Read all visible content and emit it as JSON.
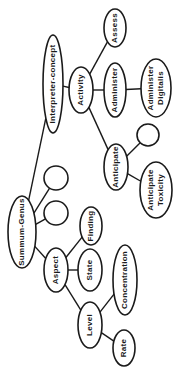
{
  "diagram": {
    "title": "",
    "orientation": "rotated -90deg",
    "nodes": [
      {
        "id": "interpreter",
        "label": "Interpreter-concept",
        "cx": 53,
        "cy": 84,
        "rx": 10,
        "ry": 49
      },
      {
        "id": "activity",
        "label": "Activity",
        "cx": 81,
        "cy": 90,
        "rx": 12,
        "ry": 23
      },
      {
        "id": "assess",
        "label": "Assess",
        "cx": 115,
        "cy": 28,
        "rx": 11,
        "ry": 19
      },
      {
        "id": "administer",
        "label": "Administer",
        "cx": 115,
        "cy": 90,
        "rx": 11,
        "ry": 27
      },
      {
        "id": "administer_digitalis",
        "label": "Administer Digitalis",
        "cx": 156,
        "cy": 88,
        "rx": 15,
        "ry": 29
      },
      {
        "id": "anticipate",
        "label": "Anticipate",
        "cx": 116,
        "cy": 167,
        "rx": 12,
        "ry": 23
      },
      {
        "id": "empty_anticipate",
        "label": "",
        "cx": 148,
        "cy": 135,
        "rx": 11,
        "ry": 11
      },
      {
        "id": "anticipate_toxicity",
        "label": "Anticipate Toxicity",
        "cx": 156,
        "cy": 190,
        "rx": 16,
        "ry": 28
      },
      {
        "id": "summum_genus",
        "label": "Summum-Genus",
        "cx": 22,
        "cy": 232,
        "rx": 14,
        "ry": 36
      },
      {
        "id": "empty_sg_1",
        "label": "",
        "cx": 56,
        "cy": 178,
        "rx": 12,
        "ry": 12
      },
      {
        "id": "empty_sg_2",
        "label": "",
        "cx": 56,
        "cy": 213,
        "rx": 12,
        "ry": 12
      },
      {
        "id": "finding",
        "label": "Finding",
        "cx": 91,
        "cy": 226,
        "rx": 11,
        "ry": 19
      },
      {
        "id": "aspect",
        "label": "Aspect",
        "cx": 56,
        "cy": 270,
        "rx": 12,
        "ry": 22
      },
      {
        "id": "state",
        "label": "State",
        "cx": 90,
        "cy": 270,
        "rx": 12,
        "ry": 21
      },
      {
        "id": "concentration",
        "label": "Concentration",
        "cx": 125,
        "cy": 280,
        "rx": 12,
        "ry": 35
      },
      {
        "id": "level",
        "label": "Level",
        "cx": 90,
        "cy": 325,
        "rx": 12,
        "ry": 23
      },
      {
        "id": "rate",
        "label": "Rate",
        "cx": 124,
        "cy": 348,
        "rx": 11,
        "ry": 18
      }
    ],
    "edges": [
      {
        "from": "summum_genus",
        "to": "interpreter"
      },
      {
        "from": "interpreter",
        "to": "activity"
      },
      {
        "from": "activity",
        "to": "assess"
      },
      {
        "from": "activity",
        "to": "administer"
      },
      {
        "from": "administer",
        "to": "administer_digitalis"
      },
      {
        "from": "activity",
        "to": "anticipate"
      },
      {
        "from": "anticipate",
        "to": "empty_anticipate"
      },
      {
        "from": "anticipate",
        "to": "anticipate_toxicity"
      },
      {
        "from": "summum_genus",
        "to": "empty_sg_1"
      },
      {
        "from": "summum_genus",
        "to": "empty_sg_2"
      },
      {
        "from": "summum_genus",
        "to": "aspect"
      },
      {
        "from": "aspect",
        "to": "finding"
      },
      {
        "from": "aspect",
        "to": "state"
      },
      {
        "from": "aspect",
        "to": "level"
      },
      {
        "from": "level",
        "to": "concentration"
      },
      {
        "from": "level",
        "to": "rate"
      }
    ]
  }
}
